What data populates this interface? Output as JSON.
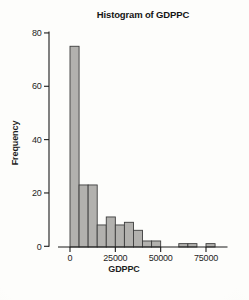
{
  "chart_data": {
    "type": "bar",
    "subtype": "histogram",
    "title": "Histogram of GDPPC",
    "xlabel": "GDPPC",
    "ylabel": "Frequency",
    "bin_start": 0,
    "bin_width": 5000,
    "bin_edges": [
      0,
      5000,
      10000,
      15000,
      20000,
      25000,
      30000,
      35000,
      40000,
      45000,
      50000,
      55000,
      60000,
      65000,
      70000,
      75000,
      80000
    ],
    "values": [
      75,
      23,
      23,
      8,
      11,
      8,
      9,
      6,
      2,
      2,
      0,
      0,
      1,
      1,
      0,
      1
    ],
    "xticks": [
      0,
      25000,
      50000,
      75000
    ],
    "yticks": [
      0,
      20,
      40,
      60,
      80
    ],
    "xlim": [
      0,
      80000
    ],
    "ylim": [
      0,
      80
    ],
    "grid": false,
    "legend_position": "none",
    "bar_fill": "#b2b1ae",
    "bar_stroke": "#3d3d3d",
    "axis_color": "#1b1b1b",
    "text_color": "#1e1e1e",
    "background": "#faf9f6"
  }
}
